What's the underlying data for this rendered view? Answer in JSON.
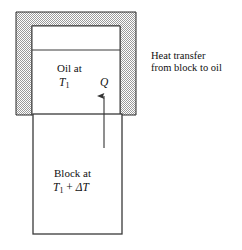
{
  "figure": {
    "title": "Heat transfer from block to oil",
    "canvas": {
      "width": 242,
      "height": 250,
      "background": "#ffffff"
    },
    "colors": {
      "stroke": "#2b2b2b",
      "hatch_light": "#ffffff",
      "hatch_dark": "#8a8a8a",
      "text": "#111111",
      "arrow": "#333333"
    },
    "container": {
      "name": "oil-container",
      "hatch_pattern": "checkerboard-dither",
      "outer": {
        "x": 16,
        "y": 12,
        "width": 120,
        "height": 103
      },
      "inner_cavity": {
        "x": 32,
        "y": 26,
        "width": 88,
        "height": 89
      },
      "oil_surface_line_y": 50
    },
    "block": {
      "name": "solid-block",
      "rect": {
        "x": 33,
        "y": 114,
        "width": 89,
        "height": 120
      }
    },
    "arrow": {
      "name": "heat-flow-arrow",
      "x": 104,
      "tail_y": 148,
      "head_y": 88,
      "direction": "up"
    },
    "labels": {
      "oil_at": "Oil at",
      "oil_temp_symbol": "T",
      "oil_temp_subscript": "1",
      "heat_symbol": "Q",
      "block_at": "Block at",
      "block_temp_symbol": "T",
      "block_temp_subscript": "1",
      "block_temp_operator": " + ",
      "block_temp_delta": "ΔT"
    },
    "caption": {
      "line1": "Heat transfer",
      "line2": "from block to oil"
    }
  }
}
